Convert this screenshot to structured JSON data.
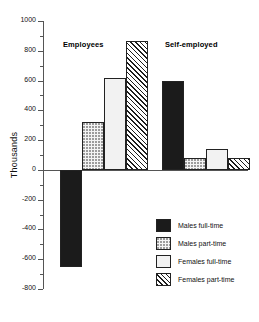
{
  "chart_data": {
    "type": "bar",
    "title": "",
    "xlabel": "",
    "ylabel": "Thousands",
    "ylim": [
      -800,
      1000
    ],
    "ytick_step": 200,
    "yminor_step": 100,
    "grid": false,
    "legend_position": "inside-bottom-right",
    "ytick_labels": [
      "1000",
      "800",
      "600",
      "400",
      "200",
      "0",
      "-200",
      "-400",
      "-600",
      "-800"
    ],
    "ytick_values": [
      1000,
      800,
      600,
      400,
      200,
      0,
      -200,
      -400,
      -600,
      -800
    ],
    "categories": [
      "Employees",
      "Self-employed"
    ],
    "series": [
      {
        "name": "Males full-time",
        "pattern": "solid-black",
        "values": [
          -655,
          595
        ]
      },
      {
        "name": "Males part-time",
        "pattern": "dotted-light",
        "values": [
          325,
          80
        ]
      },
      {
        "name": "Females full-time",
        "pattern": "plain-white",
        "values": [
          615,
          140
        ]
      },
      {
        "name": "Females part-time",
        "pattern": "diagonal-hatch",
        "values": [
          865,
          80
        ]
      }
    ]
  },
  "axis": {
    "y_title": "Thousands"
  },
  "groups": [
    {
      "label": "Employees"
    },
    {
      "label": "Self-employed"
    }
  ],
  "legend": {
    "items": [
      {
        "label": "Males full-time"
      },
      {
        "label": "Males part-time"
      },
      {
        "label": "Females full-time"
      },
      {
        "label": "Females part-time"
      }
    ]
  }
}
